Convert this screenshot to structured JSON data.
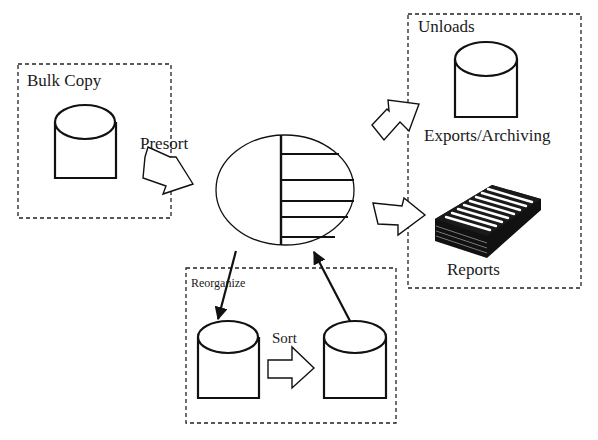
{
  "diagram": {
    "groups": {
      "bulk_copy": {
        "label": "Bulk Copy"
      },
      "unloads": {
        "label": "Unloads",
        "export_label": "Exports/Archiving",
        "reports_label": "Reports"
      },
      "reorganize": {
        "label": "Reorganize",
        "sort_label": "Sort"
      }
    },
    "arrows": {
      "presort": {
        "label": "Presort"
      }
    },
    "nodes": [
      {
        "id": "bulk-copy-db",
        "shape": "cylinder"
      },
      {
        "id": "central-table",
        "shape": "ellipse-with-rows"
      },
      {
        "id": "export-db",
        "shape": "cylinder"
      },
      {
        "id": "reports-stack",
        "shape": "paper-stack"
      },
      {
        "id": "reorg-source-db",
        "shape": "cylinder"
      },
      {
        "id": "reorg-target-db",
        "shape": "cylinder"
      }
    ],
    "edges": [
      {
        "from": "bulk-copy-db",
        "to": "central-table",
        "label": "Presort",
        "style": "block-arrow"
      },
      {
        "from": "central-table",
        "to": "export-db",
        "style": "block-arrow"
      },
      {
        "from": "central-table",
        "to": "reports-stack",
        "style": "block-arrow"
      },
      {
        "from": "central-table",
        "to": "reorg-source-db",
        "style": "line-arrow"
      },
      {
        "from": "reorg-source-db",
        "to": "reorg-target-db",
        "label": "Sort",
        "style": "block-arrow"
      },
      {
        "from": "reorg-target-db",
        "to": "central-table",
        "style": "line-arrow"
      }
    ]
  }
}
